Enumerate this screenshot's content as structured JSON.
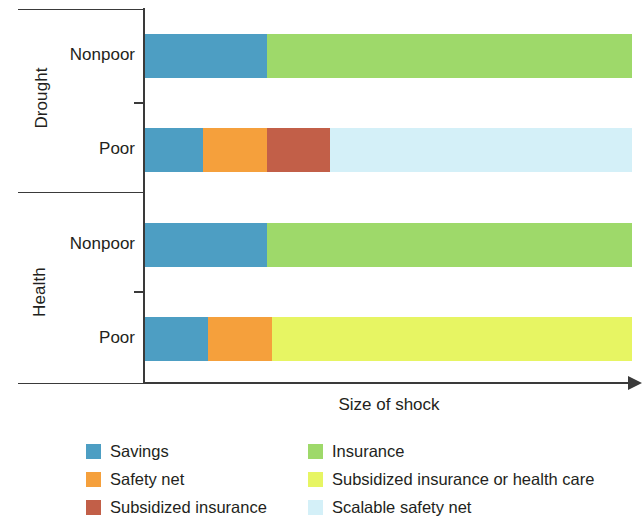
{
  "chart_data": {
    "type": "bar",
    "orientation": "horizontal",
    "stacked": true,
    "title": "",
    "xlabel": "Size of shock",
    "ylabel": "",
    "grid": false,
    "legend_position": "bottom",
    "xlim": [
      0,
      100
    ],
    "xticks": [],
    "groups": [
      {
        "name": "Drought",
        "rows": [
          {
            "label": "Nonpoor",
            "segments": [
              {
                "name": "Savings",
                "value": 25
              },
              {
                "name": "Insurance",
                "value": 75
              }
            ]
          },
          {
            "label": "Poor",
            "segments": [
              {
                "name": "Savings",
                "value": 12
              },
              {
                "name": "Safety net",
                "value": 13
              },
              {
                "name": "Subsidized insurance",
                "value": 13
              },
              {
                "name": "Scalable safety net",
                "value": 62
              }
            ]
          }
        ]
      },
      {
        "name": "Health",
        "rows": [
          {
            "label": "Nonpoor",
            "segments": [
              {
                "name": "Savings",
                "value": 25
              },
              {
                "name": "Insurance",
                "value": 75
              }
            ]
          },
          {
            "label": "Poor",
            "segments": [
              {
                "name": "Savings",
                "value": 13
              },
              {
                "name": "Safety net",
                "value": 13
              },
              {
                "name": "Subsidized insurance or health care",
                "value": 74
              }
            ]
          }
        ]
      }
    ],
    "legend": [
      {
        "label": "Savings",
        "color": "#4d9ec3"
      },
      {
        "label": "Safety net",
        "color": "#f5a03c"
      },
      {
        "label": "Subsidized insurance",
        "color": "#c25f48"
      },
      {
        "label": "Insurance",
        "color": "#9ed96a"
      },
      {
        "label": "Subsidized insurance or health care",
        "color": "#e7f563"
      },
      {
        "label": "Scalable safety net",
        "color": "#d4f0f8"
      }
    ],
    "colors": {
      "savings": "#4d9ec3",
      "safety_net": "#f5a03c",
      "subsidized_insurance": "#c25f48",
      "insurance": "#9ed96a",
      "subsidized_insurance_or_health_care": "#e7f563",
      "scalable_safety_net": "#d4f0f8",
      "axis": "#3a3a3a",
      "text": "#231f20",
      "background": "#ffffff"
    }
  }
}
